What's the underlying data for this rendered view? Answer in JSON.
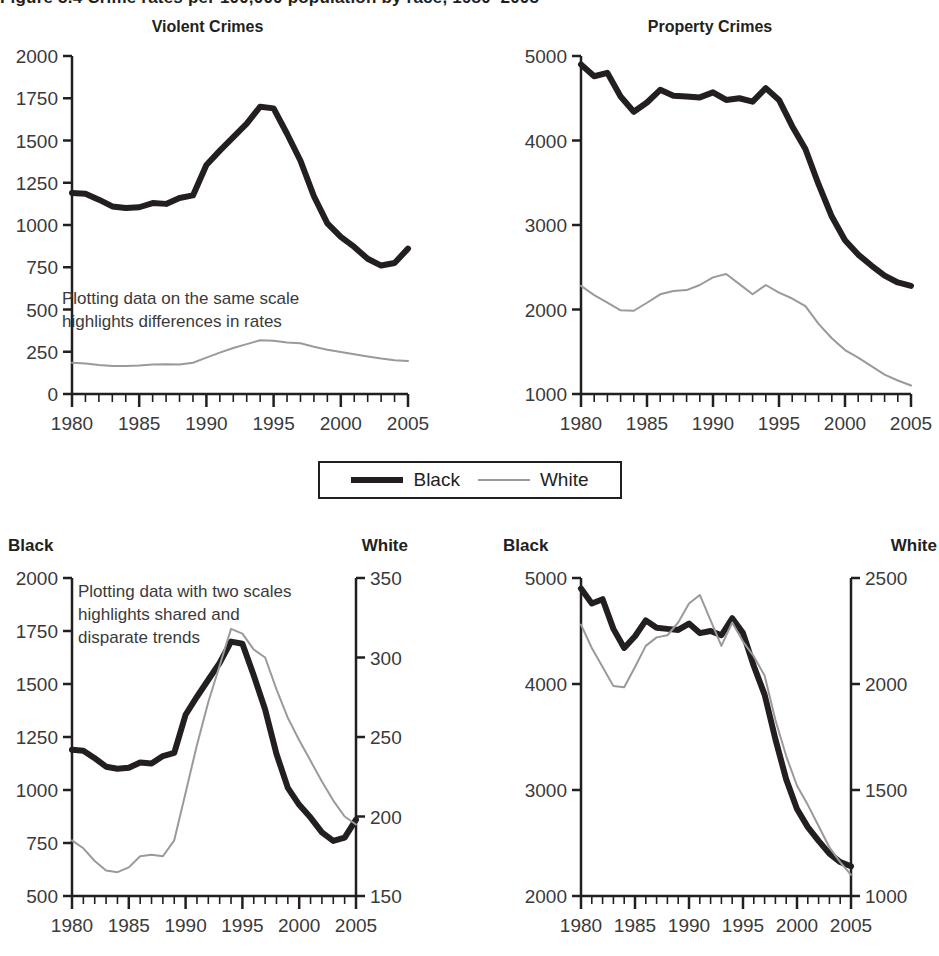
{
  "figure": {
    "title": "Figure 5.4 Crime rates per 100,000 population by race, 1980–2005"
  },
  "legend": {
    "items": [
      {
        "label": "Black",
        "style": "thick-black-line",
        "color": "#231f20"
      },
      {
        "label": "White",
        "style": "thin-gray-line",
        "color": "#9a9a9a"
      }
    ]
  },
  "axis_headers": {
    "black": "Black",
    "white": "White"
  },
  "panels": {
    "top_left": {
      "title": "Violent Crimes",
      "note": "Plotting data on the same scale\nhighlights differences in rates",
      "yticks": [
        "0",
        "250",
        "500",
        "750",
        "1000",
        "1250",
        "1500",
        "1750",
        "2000"
      ],
      "xticks": [
        "1980",
        "1985",
        "1990",
        "1995",
        "2000",
        "2005"
      ]
    },
    "top_right": {
      "title": "Property Crimes",
      "yticks": [
        "1000",
        "2000",
        "3000",
        "4000",
        "5000"
      ],
      "xticks": [
        "1980",
        "1985",
        "1990",
        "1995",
        "2000",
        "2005"
      ]
    },
    "bottom_left": {
      "note": "Plotting data with two scales\nhighlights shared and\ndisparate trends",
      "yticks_left": [
        "500",
        "750",
        "1000",
        "1250",
        "1500",
        "1750",
        "2000"
      ],
      "yticks_right": [
        "150",
        "200",
        "250",
        "300",
        "350"
      ],
      "xticks": [
        "1980",
        "1985",
        "1990",
        "1995",
        "2000",
        "2005"
      ]
    },
    "bottom_right": {
      "yticks_left": [
        "2000",
        "3000",
        "4000",
        "5000"
      ],
      "yticks_right": [
        "1000",
        "1500",
        "2000",
        "2500"
      ],
      "xticks": [
        "1980",
        "1985",
        "1990",
        "1995",
        "2000",
        "2005"
      ]
    }
  },
  "chart_data": [
    {
      "id": "violent-crimes-same-scale",
      "type": "line",
      "title": "Violent Crimes",
      "xlabel": "",
      "ylabel": "",
      "xlim": [
        1980,
        2005
      ],
      "ylim": [
        0,
        2000
      ],
      "ytick_step": 250,
      "xtick_step": 5,
      "minor_xticks": 1,
      "grid": false,
      "legend": "external-shared",
      "annotation": "Plotting data on the same scale highlights differences in rates",
      "x": [
        1980,
        1981,
        1982,
        1983,
        1984,
        1985,
        1986,
        1987,
        1988,
        1989,
        1990,
        1991,
        1992,
        1993,
        1994,
        1995,
        1996,
        1997,
        1998,
        1999,
        2000,
        2001,
        2002,
        2003,
        2004,
        2005
      ],
      "series": [
        {
          "name": "Black",
          "color": "#231f20",
          "values": [
            1190,
            1185,
            1150,
            1110,
            1100,
            1105,
            1130,
            1125,
            1160,
            1175,
            1355,
            1440,
            1520,
            1600,
            1700,
            1690,
            1540,
            1380,
            1170,
            1010,
            930,
            870,
            800,
            760,
            775,
            860
          ]
        },
        {
          "name": "White",
          "color": "#9a9a9a",
          "values": [
            185,
            180,
            172,
            166,
            165,
            168,
            175,
            176,
            175,
            185,
            215,
            245,
            272,
            295,
            318,
            315,
            305,
            300,
            280,
            262,
            248,
            235,
            222,
            210,
            200,
            195
          ]
        }
      ]
    },
    {
      "id": "property-crimes-same-scale",
      "type": "line",
      "title": "Property Crimes",
      "xlabel": "",
      "ylabel": "",
      "xlim": [
        1980,
        2005
      ],
      "ylim": [
        1000,
        5000
      ],
      "ytick_step": 1000,
      "xtick_step": 5,
      "minor_xticks": 1,
      "grid": false,
      "legend": "external-shared",
      "x": [
        1980,
        1981,
        1982,
        1983,
        1984,
        1985,
        1986,
        1987,
        1988,
        1989,
        1990,
        1991,
        1992,
        1993,
        1994,
        1995,
        1996,
        1997,
        1998,
        1999,
        2000,
        2001,
        2002,
        2003,
        2004,
        2005
      ],
      "series": [
        {
          "name": "Black",
          "color": "#231f20",
          "values": [
            4900,
            4760,
            4800,
            4520,
            4340,
            4450,
            4600,
            4530,
            4520,
            4510,
            4570,
            4480,
            4500,
            4460,
            4620,
            4480,
            4170,
            3900,
            3480,
            3100,
            2820,
            2650,
            2520,
            2400,
            2320,
            2280
          ]
        },
        {
          "name": "White",
          "color": "#9a9a9a",
          "values": [
            2280,
            2170,
            2080,
            1990,
            1985,
            2080,
            2180,
            2220,
            2230,
            2290,
            2380,
            2420,
            2300,
            2180,
            2290,
            2200,
            2130,
            2040,
            1830,
            1660,
            1520,
            1430,
            1330,
            1230,
            1160,
            1100
          ]
        }
      ]
    },
    {
      "id": "violent-crimes-dual-scale",
      "type": "line",
      "title": "",
      "xlabel": "",
      "ylabel_left": "Black",
      "ylabel_right": "White",
      "xlim": [
        1980,
        2005
      ],
      "ylim_left": [
        500,
        2000
      ],
      "ylim_right": [
        150,
        350
      ],
      "ytick_step_left": 250,
      "ytick_step_right": 50,
      "xtick_step": 5,
      "minor_xticks": 1,
      "grid": false,
      "annotation": "Plotting data with two scales highlights shared and disparate trends",
      "x": [
        1980,
        1981,
        1982,
        1983,
        1984,
        1985,
        1986,
        1987,
        1988,
        1989,
        1990,
        1991,
        1992,
        1993,
        1994,
        1995,
        1996,
        1997,
        1998,
        1999,
        2000,
        2001,
        2002,
        2003,
        2004,
        2005
      ],
      "series": [
        {
          "name": "Black",
          "axis": "left",
          "color": "#231f20",
          "values": [
            1190,
            1185,
            1150,
            1110,
            1100,
            1105,
            1130,
            1125,
            1160,
            1175,
            1355,
            1440,
            1520,
            1600,
            1700,
            1690,
            1540,
            1380,
            1170,
            1010,
            930,
            870,
            800,
            760,
            775,
            860
          ]
        },
        {
          "name": "White",
          "axis": "right",
          "color": "#9a9a9a",
          "values": [
            185,
            180,
            172,
            166,
            165,
            168,
            175,
            176,
            175,
            185,
            215,
            245,
            272,
            295,
            318,
            315,
            305,
            300,
            280,
            262,
            248,
            235,
            222,
            210,
            200,
            195
          ]
        }
      ]
    },
    {
      "id": "property-crimes-dual-scale",
      "type": "line",
      "title": "",
      "xlabel": "",
      "ylabel_left": "Black",
      "ylabel_right": "White",
      "xlim": [
        1980,
        2005
      ],
      "ylim_left": [
        2000,
        5000
      ],
      "ylim_right": [
        1000,
        2500
      ],
      "ytick_step_left": 1000,
      "ytick_step_right": 500,
      "xtick_step": 5,
      "minor_xticks": 1,
      "grid": false,
      "x": [
        1980,
        1981,
        1982,
        1983,
        1984,
        1985,
        1986,
        1987,
        1988,
        1989,
        1990,
        1991,
        1992,
        1993,
        1994,
        1995,
        1996,
        1997,
        1998,
        1999,
        2000,
        2001,
        2002,
        2003,
        2004,
        2005
      ],
      "series": [
        {
          "name": "Black",
          "axis": "left",
          "color": "#231f20",
          "values": [
            4900,
            4760,
            4800,
            4520,
            4340,
            4450,
            4600,
            4530,
            4520,
            4510,
            4570,
            4480,
            4500,
            4460,
            4620,
            4480,
            4170,
            3900,
            3480,
            3100,
            2820,
            2650,
            2520,
            2400,
            2320,
            2280
          ]
        },
        {
          "name": "White",
          "axis": "right",
          "color": "#9a9a9a",
          "values": [
            2280,
            2170,
            2080,
            1990,
            1985,
            2080,
            2180,
            2220,
            2230,
            2290,
            2380,
            2420,
            2300,
            2180,
            2290,
            2200,
            2130,
            2040,
            1830,
            1660,
            1520,
            1430,
            1330,
            1230,
            1160,
            1100
          ]
        }
      ]
    }
  ]
}
